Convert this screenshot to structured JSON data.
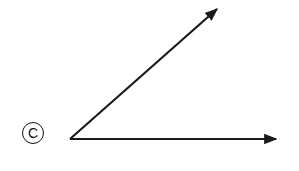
{
  "diagram": {
    "label": "C",
    "stroke_color": "#1a1a1a",
    "vertex": {
      "x": 70,
      "y": 139
    },
    "rays": [
      {
        "name": "upper-ray",
        "end": {
          "x": 220,
          "y": 7
        }
      },
      {
        "name": "horizontal-ray",
        "end": {
          "x": 279,
          "y": 139
        }
      }
    ]
  }
}
